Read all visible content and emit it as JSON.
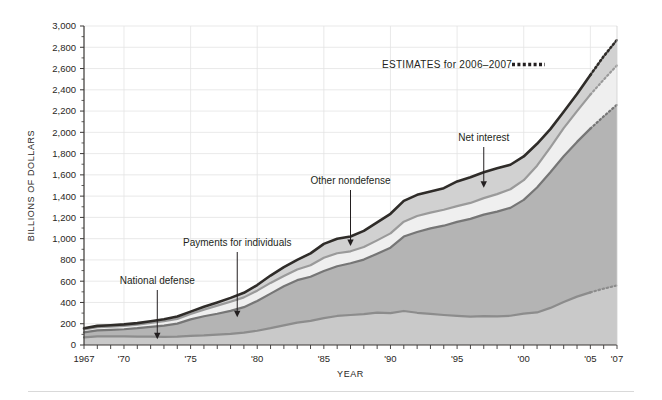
{
  "chart_data": {
    "type": "area",
    "title": "",
    "subtitle": "",
    "xlabel": "YEAR",
    "ylabel": "BILLIONS OF DOLLARS",
    "xlim": [
      1967,
      2007
    ],
    "ylim": [
      0,
      3000
    ],
    "grid": true,
    "stacked": true,
    "legend_position": "annotations",
    "x": [
      1967,
      1968,
      1969,
      1970,
      1971,
      1972,
      1973,
      1974,
      1975,
      1976,
      1977,
      1978,
      1979,
      1980,
      1981,
      1982,
      1983,
      1984,
      1985,
      1986,
      1987,
      1988,
      1989,
      1990,
      1991,
      1992,
      1993,
      1994,
      1995,
      1996,
      1997,
      1998,
      1999,
      2000,
      2001,
      2002,
      2003,
      2004,
      2005,
      2006,
      2007
    ],
    "x_tick_labels": [
      "1967",
      "'70",
      "'75",
      "'80",
      "'85",
      "'90",
      "'95",
      "'00",
      "'05",
      "'07"
    ],
    "x_tick_values": [
      1967,
      1970,
      1975,
      1980,
      1985,
      1990,
      1995,
      2000,
      2005,
      2007
    ],
    "y_tick_labels": [
      "0",
      "200",
      "400",
      "600",
      "800",
      "1,000",
      "1,200",
      "1,400",
      "1,600",
      "1,800",
      "2,000",
      "2,200",
      "2,400",
      "2,600",
      "2,800",
      "3,000"
    ],
    "y_tick_values": [
      0,
      200,
      400,
      600,
      800,
      1000,
      1200,
      1400,
      1600,
      1800,
      2000,
      2200,
      2400,
      2600,
      2800,
      3000
    ],
    "series": [
      {
        "name": "National defense",
        "color": "#c9c9c9",
        "line_color": "#8c8c8c",
        "values": [
          71,
          82,
          82,
          82,
          79,
          79,
          77,
          79,
          86,
          90,
          97,
          104,
          116,
          134,
          158,
          185,
          210,
          227,
          253,
          273,
          282,
          290,
          304,
          300,
          320,
          303,
          292,
          282,
          273,
          266,
          271,
          269,
          275,
          295,
          306,
          349,
          405,
          455,
          495,
          530,
          560
        ]
      },
      {
        "name": "Payments for individuals",
        "color": "#b4b4b4",
        "line_color": "#767676",
        "values": [
          48,
          56,
          60,
          66,
          79,
          92,
          106,
          122,
          155,
          180,
          197,
          217,
          240,
          280,
          325,
          367,
          400,
          415,
          443,
          468,
          487,
          513,
          555,
          615,
          700,
          760,
          805,
          840,
          885,
          920,
          955,
          985,
          1015,
          1070,
          1175,
          1275,
          1370,
          1455,
          1540,
          1620,
          1700
        ]
      },
      {
        "name": "Other nondefense",
        "color": "#efefef",
        "line_color": "#9a9a9a",
        "values": [
          27,
          30,
          31,
          32,
          33,
          37,
          42,
          45,
          50,
          63,
          76,
          86,
          92,
          97,
          101,
          96,
          100,
          108,
          125,
          122,
          112,
          118,
          125,
          135,
          140,
          150,
          148,
          150,
          148,
          150,
          155,
          165,
          175,
          185,
          205,
          235,
          265,
          290,
          320,
          345,
          370
        ]
      },
      {
        "name": "Net interest",
        "color": "#d1d1d1",
        "line_color": "#2f2c29",
        "values": [
          11,
          12,
          13,
          14,
          15,
          16,
          18,
          22,
          23,
          27,
          30,
          36,
          43,
          53,
          69,
          85,
          90,
          112,
          130,
          136,
          139,
          152,
          169,
          184,
          195,
          199,
          199,
          203,
          232,
          241,
          244,
          243,
          230,
          223,
          206,
          171,
          153,
          160,
          184,
          220,
          240
        ]
      }
    ],
    "estimate_years": [
      2006,
      2007
    ],
    "annotations": [
      {
        "label": "National defense",
        "year": 1972.5,
        "value": 55
      },
      {
        "label": "Payments for individuals",
        "year": 1978.5,
        "value": 260
      },
      {
        "label": "Other nondefense",
        "year": 1987.0,
        "value": 930
      },
      {
        "label": "Net interest",
        "year": 1997.0,
        "value": 1480
      }
    ],
    "legend": [
      {
        "label": "ESTIMATES for 2006–2007",
        "style": "dotted",
        "color": "#231f20"
      }
    ]
  }
}
